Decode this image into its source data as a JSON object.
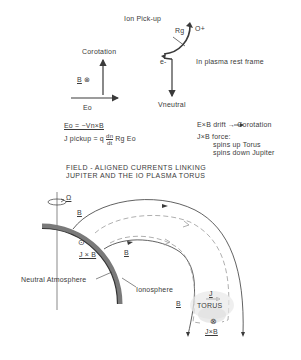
{
  "top_panel": {
    "title": "Ion Pick-up",
    "corotation_label": "Corotation",
    "b_into_page_label": "B",
    "b_into_page_symbol": "⊗",
    "eo_label": "Eo",
    "rg_label": "Rg",
    "ion_label": "O+",
    "electron_label": "e-",
    "frame_label": "In plasma rest frame",
    "vneutral_label": "Vneutral",
    "equation_1": "Eo = −Vn×B",
    "equation_2_prefix": "J pickup = q",
    "equation_2_frac_num": "dn",
    "equation_2_frac_den": "dt",
    "equation_2_suffix": "Rg Eo",
    "drift_label": "E×B drift → Corotation",
    "force_line_1": "J×B force:",
    "force_line_2": "spins up Torus",
    "force_line_3": "spins down Jupiter"
  },
  "bottom_panel": {
    "title_line_1": "FIELD - ALIGNED CURRENTS LINKING",
    "title_line_2": "JUPITER AND THE IO PLASMA TORUS",
    "omega_label": "Ω",
    "b_outer_label": "B",
    "b_inner_label": "B",
    "b_bottom_label": "B",
    "out_of_page_symbol": "⊙",
    "jxb_label": "J × B",
    "neutral_atmosphere_label": "Neutral Atmosphere",
    "ionosphere_label": "Ionosphere",
    "j_label": "J",
    "torus_label": "TORUS",
    "into_page_symbol": "⊗",
    "jxb_bottom_label": "J×B"
  },
  "colors": {
    "ink": "#3a3a3a",
    "dashed": "#9a9a9a",
    "band": "#7a7a7a"
  }
}
